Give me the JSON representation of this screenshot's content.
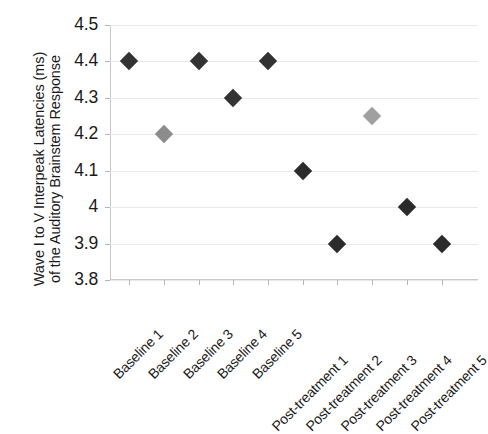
{
  "chart_data": {
    "type": "scatter",
    "title": "",
    "xlabel": "",
    "ylabel": "Wave I to V Interpeak Latencies (ms) of the Auditory Brainstem Response",
    "ylabel_lines": [
      "Wave I to V Interpeak Latencies (ms)",
      "of the Auditory Brainstem Response"
    ],
    "categories": [
      "Baseline 1",
      "Baseline 2",
      "Baseline 3",
      "Baseline 4",
      "Baseline 5",
      "Post-treatment 1",
      "Post-treatment 2",
      "Post-treatment 3",
      "Post-treatment 4",
      "Post-treatment 5"
    ],
    "values": [
      4.4,
      4.2,
      4.4,
      4.3,
      4.4,
      4.1,
      3.9,
      4.25,
      4.0,
      3.9
    ],
    "point_colors": [
      "#333333",
      "#8c8c8c",
      "#333333",
      "#333333",
      "#333333",
      "#2b2b2b",
      "#2b2b2b",
      "#a0a0a0",
      "#2b2b2b",
      "#2b2b2b"
    ],
    "ylim": [
      3.8,
      4.5
    ],
    "y_ticks": [
      4.5,
      4.4,
      4.3,
      4.2,
      4.1,
      4.0,
      3.9,
      3.8
    ],
    "y_tick_labels": [
      "4.5",
      "4.4",
      "4.3",
      "4.2",
      "4.1",
      "4",
      "3.9",
      "3.8"
    ],
    "grid": true,
    "legend": "none",
    "marker": "diamond",
    "x_label_rotation_deg": 45
  },
  "colors": {
    "marker_dark": "#333333",
    "marker_gray": "#9a9a9a",
    "gridline": "#e9e9e9",
    "axis": "#c9c9c9",
    "text": "#1a1a1a",
    "background": "#ffffff"
  }
}
